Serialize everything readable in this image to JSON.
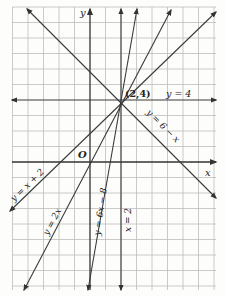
{
  "figure": {
    "origin_px": [
      90,
      162
    ],
    "unit_px": 15.5,
    "grid": {
      "x_min": -5,
      "x_max": 8,
      "y_min": -8,
      "y_max": 10,
      "color": "#b9b9b9"
    },
    "axis_color": "#333333",
    "line_color": "#3a3a3a",
    "axis_labels": {
      "x": "x",
      "y": "y",
      "origin": "O"
    },
    "point": {
      "label": "(2,4)",
      "x": 2,
      "y": 4
    },
    "lines": [
      {
        "id": "y-eq-4",
        "label": "y = 4",
        "eq": "y=4"
      },
      {
        "id": "y-eq-6-minus-x",
        "label": "y = 6 − x",
        "eq": "y=6-x"
      },
      {
        "id": "y-eq-x-plus-2",
        "label": "y = x + 2",
        "eq": "y=x+2"
      },
      {
        "id": "y-eq-2x",
        "label": "y = 2x",
        "eq": "y=2x"
      },
      {
        "id": "y-eq-6x-minus-8",
        "label": "y = 6x − 8",
        "eq": "y=6x-8"
      },
      {
        "id": "x-eq-2",
        "label": "x = 2",
        "eq": "x=2"
      }
    ]
  }
}
